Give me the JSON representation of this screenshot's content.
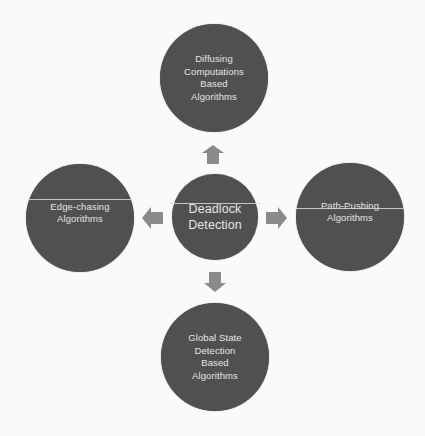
{
  "diagram": {
    "title": "Deadlock Detection",
    "center": {
      "label": "Deadlock\nDetection"
    },
    "nodes": {
      "top": {
        "label": "Diffusing\nComputations\nBased\nAlgorithms"
      },
      "left": {
        "label": "Edge-chasing\nAlgorithms"
      },
      "right": {
        "label": "Path-Pushing\nAlgorithms"
      },
      "bottom": {
        "label": "Global State\nDetection\nBased\nAlgorithms"
      }
    },
    "arrows": [
      "up",
      "left",
      "right",
      "down"
    ],
    "colors": {
      "background": "#fafafa",
      "circle_fill": "#505050",
      "circle_text": "#e4e4e4",
      "arrow_fill": "#8a8a8a"
    }
  }
}
